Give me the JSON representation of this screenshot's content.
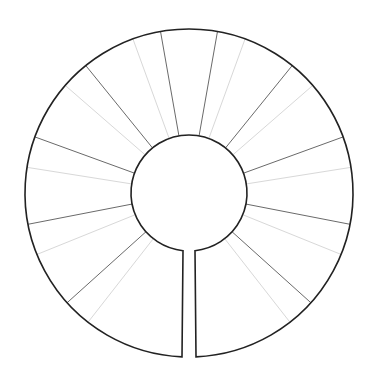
{
  "diagram": {
    "type": "blank-ring-wheel",
    "center": [
      189,
      193
    ],
    "inner_radius": 58,
    "outer_radius": 164,
    "gap": {
      "inner_half_width": 6,
      "outer_half_width": 7
    },
    "colors": {
      "outline": "#222222",
      "major_divider": "#6a6a6a",
      "minor_divider": "#d8d8d8",
      "background": "#ffffff"
    },
    "major_divider_angles": [
      -132,
      -101,
      -70,
      -39,
      -10,
      10,
      39,
      70,
      101,
      132
    ],
    "minor_divider_angles": [
      -142,
      -112,
      -81,
      -49,
      -20,
      20,
      49,
      81,
      112,
      142
    ]
  }
}
